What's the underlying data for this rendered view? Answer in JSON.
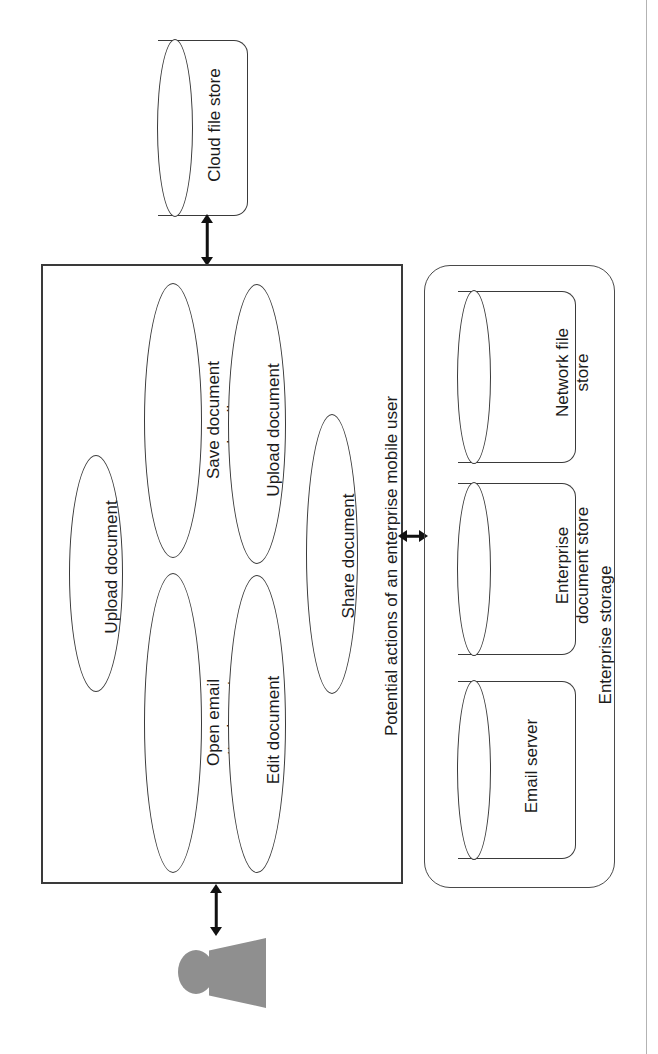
{
  "diagram": {
    "type": "use-case-diagram",
    "orientation": "rotated-90-clockwise",
    "system_boundary_label": "Potential actions of an enterprise mobile user",
    "actor_name": "enterprise mobile user",
    "use_cases": [
      {
        "id": "upload-document-1",
        "label": "Upload document"
      },
      {
        "id": "save-document-locally",
        "label": "Save document\nlocally"
      },
      {
        "id": "upload-document-2",
        "label": "Upload document"
      },
      {
        "id": "open-email-attachment",
        "label": "Open email\nattachment"
      },
      {
        "id": "edit-document",
        "label": "Edit document"
      },
      {
        "id": "share-document",
        "label": "Share document"
      }
    ],
    "external_stores": [
      {
        "id": "cloud-file-store",
        "label": "Cloud file store"
      }
    ],
    "storage_group": {
      "label": "Enterprise storage",
      "stores": [
        {
          "id": "network-file-store",
          "label": "Network file\nstore"
        },
        {
          "id": "enterprise-document-store",
          "label": "Enterprise\ndocument store"
        },
        {
          "id": "email-server",
          "label": "Email server"
        }
      ]
    },
    "connections": [
      {
        "id": "conn-cloud-system",
        "from": "system-boundary",
        "to": "cloud-file-store",
        "style": "double-arrow"
      },
      {
        "id": "conn-system-storage",
        "from": "system-boundary",
        "to": "enterprise-storage",
        "style": "double-arrow"
      },
      {
        "id": "conn-actor-system",
        "from": "actor",
        "to": "system-boundary",
        "style": "double-arrow"
      }
    ],
    "colors": {
      "stroke": "#3a3a3a",
      "actor_fill": "#8f8f8f",
      "background": "#ffffff",
      "text": "#1b1b1b"
    }
  }
}
